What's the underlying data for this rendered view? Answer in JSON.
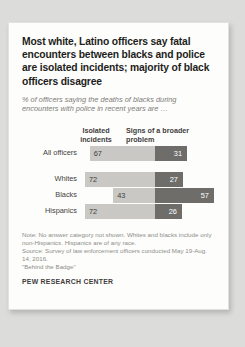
{
  "title": "Most white, Latino officers say fatal encounters between blacks and police are isolated incidents; majority of black officers disagree",
  "subtitle": "% of officers saying the deaths of blacks during encounters with police in recent years are …",
  "footer": {
    "note": "Note: No answer category not shown. Whites and blacks include only non-Hispanics. Hispanics are of any race.",
    "source": "Source: Survey of law enforcement officers conducted May 19-Aug. 14, 2016.",
    "report": "\"Behind the Badge\"",
    "brand": "PEW RESEARCH CENTER"
  },
  "colors": {
    "isolated": "#c9c8c4",
    "broader": "#6e6d6a",
    "card": "#fdfdfc",
    "page": "#dcdcda"
  },
  "chart_data": {
    "type": "bar",
    "title": "Most white, Latino officers say fatal encounters between blacks and police are isolated incidents; majority of black officers disagree",
    "subtitle": "% of officers saying the deaths of blacks during encounters with police in recent years are …",
    "xlabel": "",
    "ylabel": "",
    "orientation": "horizontal",
    "stacked": "diverging",
    "grid": false,
    "legend_position": "top",
    "categories": [
      "All officers",
      "Whites",
      "Blacks",
      "Hispanics"
    ],
    "series": [
      {
        "name": "Isolated incidents",
        "color": "#c9c8c4",
        "values": [
          67,
          72,
          43,
          72
        ]
      },
      {
        "name": "Signs of a broader problem",
        "color": "#6e6d6a",
        "values": [
          31,
          27,
          57,
          26
        ]
      }
    ],
    "rows": [
      {
        "label": "All officers",
        "isolated": 67,
        "broader": 31,
        "group_break_after": true
      },
      {
        "label": "Whites",
        "isolated": 72,
        "broader": 27,
        "group_break_after": false
      },
      {
        "label": "Blacks",
        "isolated": 43,
        "broader": 57,
        "group_break_after": false
      },
      {
        "label": "Hispanics",
        "isolated": 72,
        "broader": 26,
        "group_break_after": false
      }
    ],
    "column_headers": [
      "Isolated incidents",
      "Signs of a broader problem"
    ]
  }
}
